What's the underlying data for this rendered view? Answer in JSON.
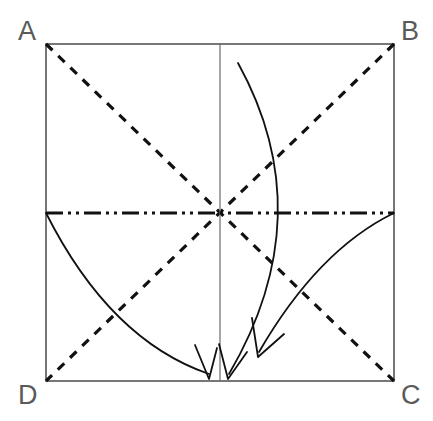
{
  "figure": {
    "kind": "geometry-diagram",
    "background_color": "#ffffff",
    "width": 433,
    "height": 421
  },
  "colors": {
    "square_stroke": "#555555",
    "center_line": "#6b6b6b",
    "dashed_diagonal": "#111111",
    "dashdot_axis": "#111111",
    "arc_stroke": "#111111",
    "label_fill": "#5a5a5a"
  },
  "square": {
    "name": "ABCD",
    "left": 46,
    "top": 44,
    "right": 394,
    "bottom": 381,
    "stroke_width": 1.6
  },
  "vertices": [
    {
      "id": "A",
      "label": "A",
      "corner": "top-left",
      "x": 46,
      "y": 44,
      "label_x": 18,
      "label_y": 40
    },
    {
      "id": "B",
      "label": "B",
      "corner": "top-right",
      "x": 394,
      "y": 44,
      "label_x": 401,
      "label_y": 40
    },
    {
      "id": "C",
      "label": "C",
      "corner": "bottom-right",
      "x": 394,
      "y": 381,
      "label_x": 401,
      "label_y": 404
    },
    {
      "id": "D",
      "label": "D",
      "corner": "bottom-left",
      "x": 46,
      "y": 381,
      "label_x": 18,
      "label_y": 404
    }
  ],
  "center": {
    "x": 220,
    "y": 213
  },
  "construction_lines": [
    {
      "id": "diagonal-ac",
      "label": "diagonal A to C",
      "style": "dashed",
      "x1": 46,
      "y1": 44,
      "x2": 394,
      "y2": 381,
      "dash_pattern": "9 8",
      "stroke_width": 3.2
    },
    {
      "id": "diagonal-bd",
      "label": "diagonal B to D",
      "style": "dashed",
      "x1": 394,
      "y1": 44,
      "x2": 46,
      "y2": 381,
      "dash_pattern": "9 8",
      "stroke_width": 3.2
    },
    {
      "id": "vertical-center-line",
      "label": "vertical centre line",
      "style": "solid-thin",
      "x1": 220,
      "y1": 44,
      "x2": 220,
      "y2": 381,
      "stroke_width": 1.2
    },
    {
      "id": "horizontal-axis-line",
      "label": "horizontal centre axis",
      "style": "dash-dot-dot",
      "x1": 46,
      "y1": 213,
      "x2": 394,
      "y2": 213,
      "dash_pattern": "17 5 3 5 3 5",
      "stroke_width": 3.0
    }
  ],
  "arcs": [
    {
      "id": "arc-left-fold",
      "label": "left fold arc from midpoint of AD to bottom centre",
      "start": {
        "x": 46,
        "y": 213
      },
      "control": {
        "x": 110,
        "y": 340
      },
      "end": {
        "x": 209,
        "y": 374
      },
      "arrowhead": {
        "x": 209,
        "y": 378,
        "angle_deg": 72
      },
      "stroke_width": 1.8
    },
    {
      "id": "arc-long-fold",
      "label": "long fold arc from top edge curving to bottom centre",
      "start": {
        "x": 238,
        "y": 63
      },
      "control": {
        "x": 322,
        "y": 215
      },
      "end": {
        "x": 229,
        "y": 374
      },
      "arrowhead": {
        "x": 228,
        "y": 378,
        "angle_deg": 100
      },
      "stroke_width": 1.8
    },
    {
      "id": "arc-right-fold",
      "label": "right fold arc from midpoint of BC to lower centre",
      "start": {
        "x": 394,
        "y": 213
      },
      "control": {
        "x": 318,
        "y": 250
      },
      "end": {
        "x": 259,
        "y": 352
      },
      "arrowhead": {
        "x": 258,
        "y": 356,
        "angle_deg": 118
      },
      "stroke_width": 1.8
    }
  ],
  "arrow_markers": [
    {
      "id": "arrowhead-left",
      "tip_x": 209,
      "tip_y": 379,
      "direction": "down"
    },
    {
      "id": "arrowhead-middle",
      "tip_x": 228,
      "tip_y": 379,
      "direction": "down-left"
    },
    {
      "id": "arrowhead-right",
      "tip_x": 258,
      "tip_y": 357,
      "direction": "down-left"
    }
  ]
}
